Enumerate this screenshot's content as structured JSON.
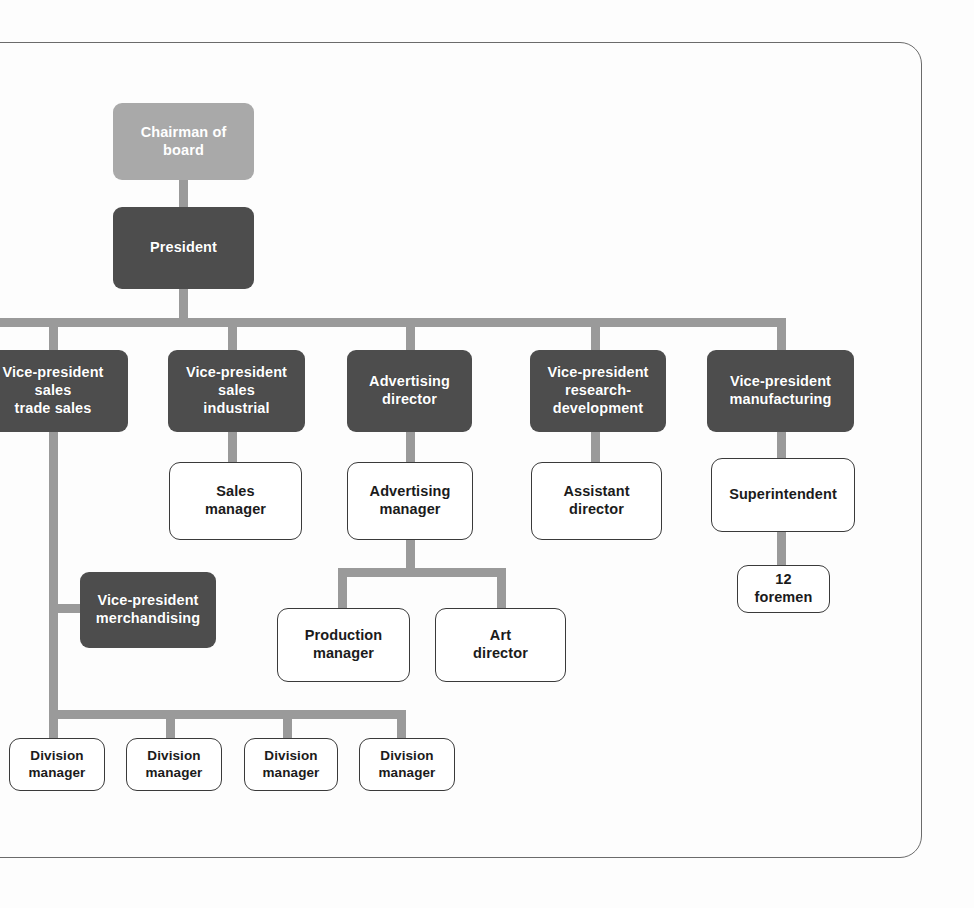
{
  "diagram": {
    "type": "organizational-chart",
    "colors": {
      "chairman_fill": "#a9a9a9",
      "executive_fill": "#4d4d4d",
      "executive_text": "#ffffff",
      "open_box_fill": "#ffffff",
      "open_box_border": "#3a3a3a",
      "connector": "#9a9a9a",
      "page_frame": "#6b6b6b",
      "background": "#ffffff"
    },
    "nodes": [
      {
        "id": "chairman",
        "label": "Chairman of board",
        "style": "light",
        "level": 1
      },
      {
        "id": "president",
        "label": "President",
        "style": "dark",
        "level": 2
      },
      {
        "id": "vp_trade",
        "label": "Vice-president\nsales\ntrade sales",
        "style": "dark",
        "level": 3
      },
      {
        "id": "vp_industrial",
        "label": "Vice-president\nsales\nindustrial",
        "style": "dark",
        "level": 3
      },
      {
        "id": "adv_director",
        "label": "Advertising\ndirector",
        "style": "dark",
        "level": 3
      },
      {
        "id": "vp_research",
        "label": "Vice-president\nresearch-\ndevelopment",
        "style": "dark",
        "level": 3
      },
      {
        "id": "vp_manufacturing",
        "label": "Vice-president\nmanufacturing",
        "style": "dark",
        "level": 3
      },
      {
        "id": "sales_manager",
        "label": "Sales\nmanager",
        "style": "open",
        "level": 4
      },
      {
        "id": "adv_manager",
        "label": "Advertising\nmanager",
        "style": "open",
        "level": 4
      },
      {
        "id": "asst_director",
        "label": "Assistant\ndirector",
        "style": "open",
        "level": 4
      },
      {
        "id": "superintendent",
        "label": "Superintendent",
        "style": "open",
        "level": 4
      },
      {
        "id": "vp_merch",
        "label": "Vice-president\nmerchandising",
        "style": "dark",
        "level": 4
      },
      {
        "id": "production_mgr",
        "label": "Production\nmanager",
        "style": "open",
        "level": 5
      },
      {
        "id": "art_director",
        "label": "Art\ndirector",
        "style": "open",
        "level": 5
      },
      {
        "id": "foremen",
        "label": "12\nforemen",
        "style": "open",
        "level": 5
      },
      {
        "id": "division_1",
        "label": "Division\nmanager",
        "style": "open",
        "level": 6
      },
      {
        "id": "division_2",
        "label": "Division\nmanager",
        "style": "open",
        "level": 6
      },
      {
        "id": "division_3",
        "label": "Division\nmanager",
        "style": "open",
        "level": 6
      },
      {
        "id": "division_4",
        "label": "Division\nmanager",
        "style": "open",
        "level": 6
      }
    ],
    "edges": [
      {
        "from": "chairman",
        "to": "president"
      },
      {
        "from": "president",
        "to": "vp_trade"
      },
      {
        "from": "president",
        "to": "vp_industrial"
      },
      {
        "from": "president",
        "to": "adv_director"
      },
      {
        "from": "president",
        "to": "vp_research"
      },
      {
        "from": "president",
        "to": "vp_manufacturing"
      },
      {
        "from": "vp_industrial",
        "to": "sales_manager"
      },
      {
        "from": "adv_director",
        "to": "adv_manager"
      },
      {
        "from": "vp_research",
        "to": "asst_director"
      },
      {
        "from": "vp_manufacturing",
        "to": "superintendent"
      },
      {
        "from": "superintendent",
        "to": "foremen"
      },
      {
        "from": "adv_manager",
        "to": "production_mgr"
      },
      {
        "from": "adv_manager",
        "to": "art_director"
      },
      {
        "from": "vp_trade",
        "to": "vp_merch"
      },
      {
        "from": "vp_trade",
        "to": "division_1"
      },
      {
        "from": "vp_trade",
        "to": "division_2"
      },
      {
        "from": "vp_trade",
        "to": "division_3"
      },
      {
        "from": "vp_trade",
        "to": "division_4"
      }
    ]
  }
}
